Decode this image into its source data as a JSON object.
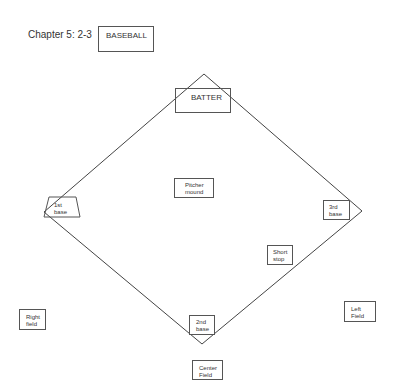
{
  "header": {
    "chapter": "Chapter 5: 2-3",
    "title_box": "BASEBALL"
  },
  "positions": {
    "batter": "BATTER",
    "pitcher": [
      "Pitcher",
      "mound"
    ],
    "first_base": [
      "1st",
      "base"
    ],
    "third_base": [
      "3rd",
      "base"
    ],
    "short_stop": [
      "Short",
      "stop"
    ],
    "second_base": [
      "2nd",
      "base"
    ],
    "right_field": [
      "Right",
      "field"
    ],
    "left_field": [
      "Left",
      "Field"
    ],
    "center_field": [
      "Center",
      "Field"
    ]
  },
  "colors": {
    "line": "#444444",
    "background": "#ffffff"
  }
}
